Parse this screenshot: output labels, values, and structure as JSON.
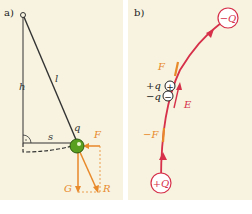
{
  "panels": [
    {
      "id": "a",
      "label": "a)",
      "symbols": {
        "height": "h",
        "length": "l",
        "displacement": "s",
        "charge": "q",
        "force": "F",
        "gravity": "G",
        "resultant": "R"
      }
    },
    {
      "id": "b",
      "label": "b)",
      "symbols": {
        "top_charge": "−Q",
        "bottom_charge": "+Q",
        "force": "F",
        "neg_force": "−F",
        "field": "E",
        "plus_q": "+q",
        "minus_q": "−q"
      }
    }
  ],
  "colors": {
    "background": "#f7f3e0",
    "force_orange": "#e8892a",
    "field_red": "#d6304a",
    "ball_green": "#5aa020",
    "line_dark": "#333333"
  }
}
